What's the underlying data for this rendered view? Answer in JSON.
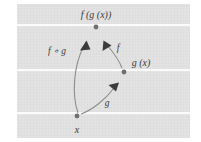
{
  "figure": {
    "background": {
      "panel_color": "#e0e0e0",
      "band_separator_color": "#fafafa",
      "outer_color": "#ffffff",
      "panel": {
        "x": 17,
        "y": 4,
        "width": 173,
        "height": 134
      },
      "band_separators_y": [
        25,
        70,
        113
      ]
    },
    "points": [
      {
        "id": "x",
        "label": "x",
        "cx": 77,
        "cy": 116,
        "color": "#6f6f6f"
      },
      {
        "id": "gx",
        "label": "g (x)",
        "cx": 124,
        "cy": 72,
        "color": "#6f6f6f"
      },
      {
        "id": "fgx",
        "label": "f (g (x))",
        "cx": 96,
        "cy": 27,
        "color": "#6f6f6f"
      }
    ],
    "point_labels": [
      {
        "id": "label-fgx",
        "text": "f (g (x))",
        "x": 96,
        "y": 18
      },
      {
        "id": "label-gx",
        "text": "g (x)",
        "x": 141,
        "y": 66
      },
      {
        "id": "label-x",
        "text": "x",
        "x": 77,
        "y": 132
      }
    ],
    "arrows": [
      {
        "id": "arrow-g",
        "label": "g",
        "from": "x",
        "to": "gx",
        "label_x": 107,
        "label_y": 104,
        "color": "#8a8a8a"
      },
      {
        "id": "arrow-f",
        "label": "f",
        "from": "gx",
        "to": "fgx",
        "label_x": 117,
        "label_y": 50,
        "color": "#8a8a8a"
      },
      {
        "id": "arrow-fog",
        "label": "f ∘ g",
        "from": "x",
        "to": "fgx",
        "label_x": 58,
        "label_y": 52,
        "color": "#8a8a8a"
      }
    ],
    "arrowhead_color": "#3c3c3c"
  }
}
